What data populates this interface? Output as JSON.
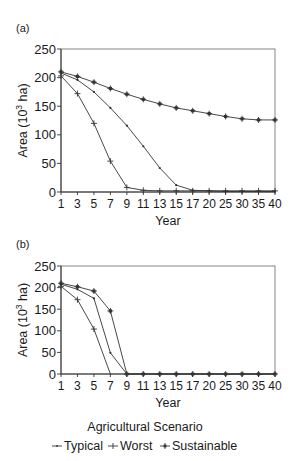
{
  "figure": {
    "legend_title": "Agricultural Scenario",
    "legend": [
      {
        "name": "Typical",
        "marker": "dot"
      },
      {
        "name": "Worst",
        "marker": "plus"
      },
      {
        "name": "Sustainable",
        "marker": "asterisk-box"
      }
    ]
  },
  "chart_data": [
    {
      "panel_label": "(a)",
      "type": "line",
      "title": "",
      "xlabel": "Year",
      "ylabel": "Area (10^3 ha)",
      "ylabel_parts": {
        "prefix": "Area (10",
        "sup": "3",
        "suffix": " ha)"
      },
      "ylim": [
        0,
        250
      ],
      "yticks": [
        0,
        50,
        100,
        150,
        200,
        250
      ],
      "categories": [
        "1",
        "3",
        "5",
        "7",
        "9",
        "11",
        "13",
        "15",
        "17",
        "20",
        "25",
        "30",
        "35",
        "40"
      ],
      "grid": false,
      "legend_position": "bottom",
      "series": [
        {
          "name": "Typical",
          "marker": "dot",
          "values": [
            208,
            196,
            175,
            147,
            116,
            80,
            42,
            12,
            3,
            2,
            1,
            1,
            1,
            1
          ]
        },
        {
          "name": "Worst",
          "marker": "plus",
          "values": [
            203,
            172,
            120,
            54,
            8,
            3,
            2,
            2,
            2,
            2,
            2,
            2,
            2,
            2
          ]
        },
        {
          "name": "Sustainable",
          "marker": "asterisk-box",
          "values": [
            210,
            202,
            192,
            181,
            171,
            162,
            154,
            147,
            142,
            137,
            132,
            128,
            126,
            126
          ]
        }
      ]
    },
    {
      "panel_label": "(b)",
      "type": "line",
      "title": "",
      "xlabel": "Year",
      "ylabel": "Area (10^3 ha)",
      "ylabel_parts": {
        "prefix": "Area (10",
        "sup": "3",
        "suffix": " ha)"
      },
      "ylim": [
        0,
        250
      ],
      "yticks": [
        0,
        50,
        100,
        150,
        200,
        250
      ],
      "categories": [
        "1",
        "3",
        "5",
        "7",
        "9",
        "11",
        "13",
        "15",
        "17",
        "20",
        "25",
        "30",
        "35",
        "40"
      ],
      "grid": false,
      "legend_position": "bottom",
      "series": [
        {
          "name": "Typical",
          "marker": "dot",
          "values": [
            208,
            196,
            175,
            49,
            0,
            0,
            0,
            0,
            0,
            0,
            0,
            0,
            0,
            0
          ]
        },
        {
          "name": "Worst",
          "marker": "plus",
          "values": [
            203,
            172,
            104,
            0,
            null,
            null,
            null,
            null,
            null,
            null,
            null,
            null,
            null,
            null
          ]
        },
        {
          "name": "Sustainable",
          "marker": "asterisk-box",
          "values": [
            210,
            202,
            192,
            146,
            0,
            0,
            0,
            0,
            0,
            0,
            0,
            0,
            0,
            0
          ]
        }
      ]
    }
  ]
}
